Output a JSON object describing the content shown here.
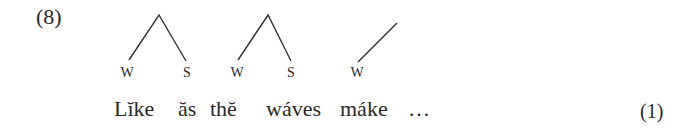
{
  "example_number": "(8)",
  "equation_number": "(1)",
  "trees": [
    {
      "apex": [
        159,
        15
      ],
      "left": [
        129,
        60
      ],
      "right": [
        186,
        61
      ],
      "labels": [
        "W",
        "S"
      ]
    },
    {
      "apex": [
        268,
        15
      ],
      "left": [
        238,
        60
      ],
      "right": [
        291,
        61
      ],
      "labels": [
        "W",
        "S"
      ]
    },
    {
      "apex": null,
      "top": [
        397,
        23
      ],
      "left": [
        358,
        62
      ],
      "labels": [
        "W"
      ]
    }
  ],
  "labels": {
    "t1_left": "W",
    "t1_right": "S",
    "t2_left": "W",
    "t2_right": "S",
    "t3_left": "W"
  },
  "words": [
    "Lĭke",
    "ăs",
    "thĕ",
    "wáves",
    "máke",
    "…"
  ]
}
